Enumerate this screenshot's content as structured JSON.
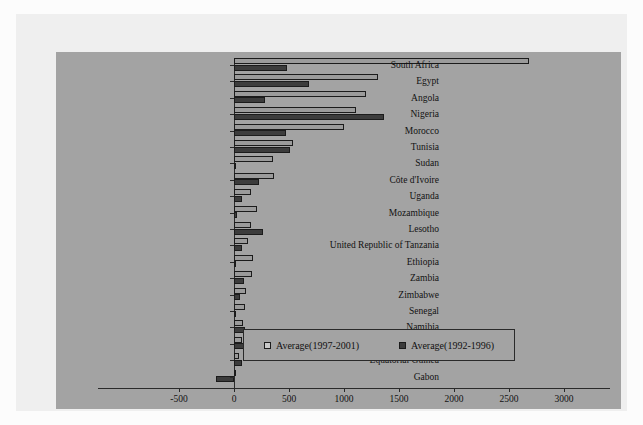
{
  "chart_data": {
    "type": "bar",
    "orientation": "horizontal",
    "title": "",
    "xlabel": "",
    "ylabel": "",
    "xlim": [
      -500,
      3000
    ],
    "xticks": [
      -500,
      0,
      500,
      1000,
      1500,
      2000,
      2500,
      3000
    ],
    "grid": false,
    "legend_position": "inside-lower-center",
    "categories": [
      "South Africa",
      "Egypt",
      "Angola",
      "Nigeria",
      "Morocco",
      "Tunisia",
      "Sudan",
      "Côte d'Ivoire",
      "Uganda",
      "Mozambique",
      "Lesotho",
      "United Republic  of Tanzania",
      "Ethiopia",
      "Zambia",
      "Zimbabwe",
      "Senegal",
      "Namibia",
      "Ghana",
      "Equatorial Guinea",
      "Gabon"
    ],
    "series": [
      {
        "name": "Average(1997-2001)",
        "color": "#9b9b9b",
        "values": [
          2680,
          1310,
          1200,
          1110,
          1000,
          535,
          355,
          365,
          155,
          210,
          155,
          130,
          175,
          165,
          110,
          100,
          80,
          75,
          45,
          5
        ]
      },
      {
        "name": "Average(1992-1996)",
        "color": "#3c3c3c",
        "values": [
          480,
          680,
          280,
          1365,
          475,
          510,
          10,
          225,
          75,
          25,
          265,
          75,
          20,
          90,
          55,
          10,
          100,
          200,
          75,
          -165
        ]
      }
    ]
  },
  "legend": {
    "items": [
      {
        "label": "Average(1997-2001)",
        "style": "light"
      },
      {
        "label": "Average(1992-1996)",
        "style": "dark"
      }
    ]
  }
}
